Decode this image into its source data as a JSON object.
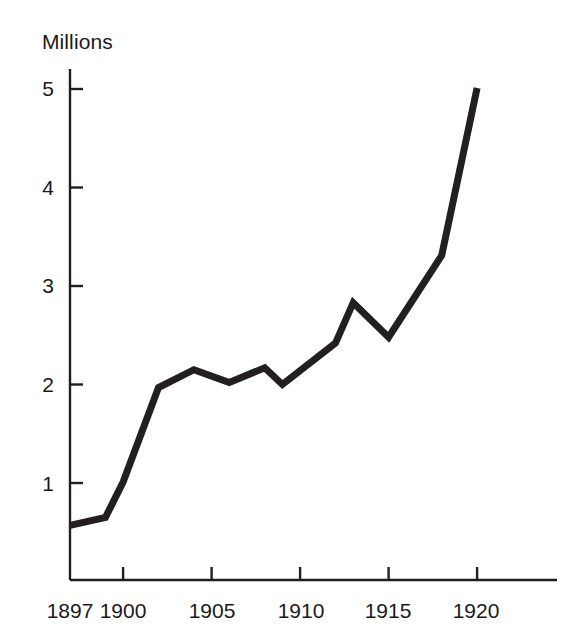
{
  "chart_data": {
    "type": "line",
    "title": "",
    "subtitle": "",
    "ylabel": "Millions",
    "xlabel": "",
    "ylim": [
      0,
      5.2
    ],
    "xlim": [
      1897,
      1922.5
    ],
    "grid": false,
    "legend": null,
    "y_ticks": [
      1,
      2,
      3,
      4,
      5
    ],
    "y_tick_labels": [
      "1",
      "2",
      "3",
      "4",
      "5"
    ],
    "x_ticks": [
      1897,
      1900,
      1905,
      1910,
      1915,
      1920
    ],
    "x_tick_labels": [
      "1897",
      "1900",
      "1905",
      "1910",
      "1915",
      "1920"
    ],
    "series": [
      {
        "name": "Millions",
        "color": "#231f20",
        "line_width": 7,
        "x": [
          1897,
          1899,
          1900,
          1902,
          1904,
          1906,
          1908,
          1909,
          1912,
          1913,
          1915,
          1918,
          1920
        ],
        "values": [
          0.57,
          0.65,
          1.01,
          1.97,
          2.15,
          2.02,
          2.17,
          2.0,
          2.42,
          2.83,
          2.48,
          3.31,
          5.01
        ]
      }
    ],
    "axis_color": "#231f20"
  }
}
